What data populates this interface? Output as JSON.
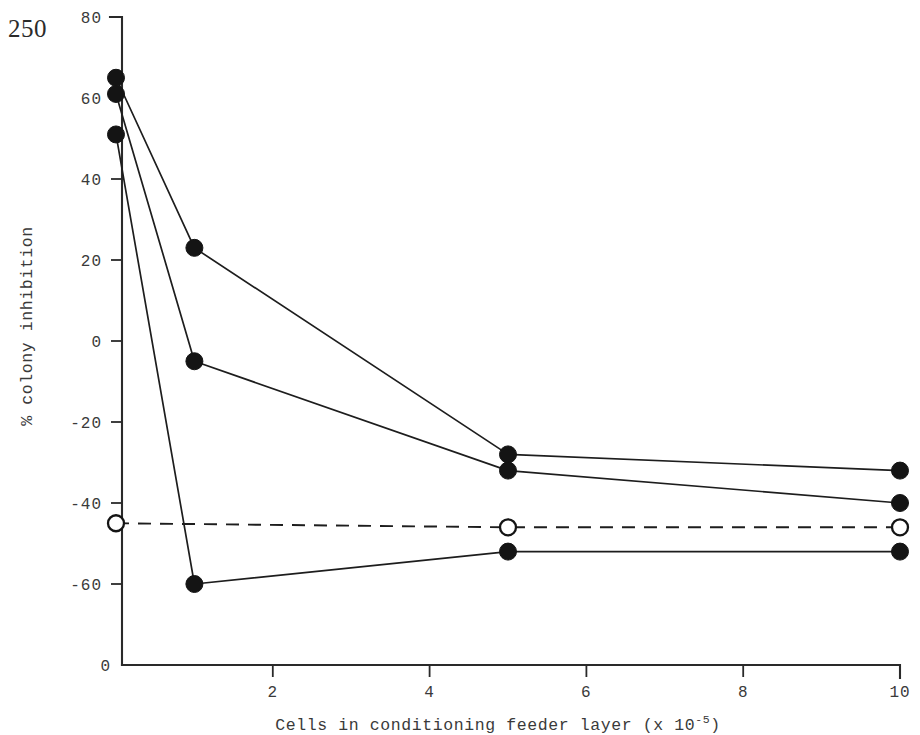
{
  "page": {
    "page_number": "250"
  },
  "chart_data": {
    "type": "line",
    "title": "",
    "xlabel": "Cells in conditioning feeder layer (x 10",
    "xlabel_superscript": "-5",
    "xlabel_suffix": ")",
    "ylabel": "% colony inhibition",
    "xlim": [
      0,
      10
    ],
    "ylim": [
      -60,
      80
    ],
    "grid": false,
    "legend": "none",
    "x_ticks": [
      0,
      2,
      4,
      6,
      8,
      10
    ],
    "x_tick_labels": [
      "0",
      "2",
      "4",
      "6",
      "8",
      "10"
    ],
    "y_ticks": [
      -60,
      -40,
      -20,
      0,
      20,
      40,
      60,
      80
    ],
    "y_tick_labels": [
      "-60",
      "-40",
      "-20",
      "0",
      "20",
      "40",
      "60",
      "80"
    ],
    "y_origin_label": "0",
    "series": [
      {
        "name": "series-1-filled-upper",
        "marker": "filled-circle",
        "linestyle": "solid",
        "color": "#141414",
        "x": [
          0,
          1,
          5,
          10
        ],
        "values": [
          65,
          23,
          -28,
          -32
        ]
      },
      {
        "name": "series-2-filled-middle",
        "marker": "filled-circle",
        "linestyle": "solid",
        "color": "#141414",
        "x": [
          0,
          1,
          5,
          10
        ],
        "values": [
          61,
          -5,
          -32,
          -40
        ]
      },
      {
        "name": "series-3-filled-lower",
        "marker": "filled-circle",
        "linestyle": "solid",
        "color": "#141414",
        "x": [
          0,
          1,
          5,
          10
        ],
        "values": [
          51,
          -60,
          -52,
          -52
        ]
      },
      {
        "name": "series-4-open-control",
        "marker": "open-circle",
        "linestyle": "dashed",
        "color": "#141414",
        "x": [
          0,
          5,
          10
        ],
        "values": [
          -45,
          -46,
          -46
        ]
      }
    ]
  }
}
